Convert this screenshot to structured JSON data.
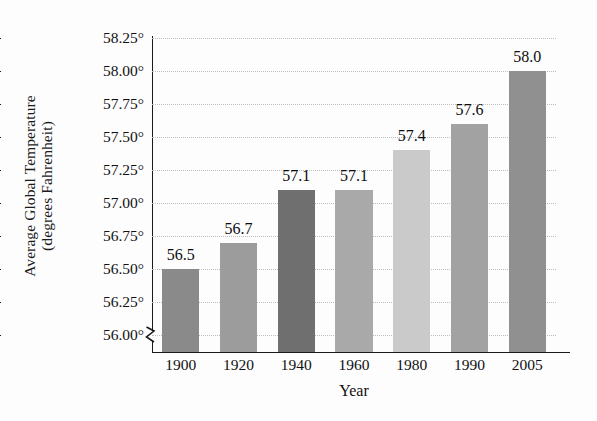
{
  "chart_data": {
    "type": "bar",
    "title": "",
    "xlabel": "Year",
    "ylabel": "Average Global Temperature (degrees Fahrenheit)",
    "ylabel_lines": [
      "Average Global Temperature",
      "(degrees Fahrenheit)"
    ],
    "categories": [
      "1900",
      "1920",
      "1940",
      "1960",
      "1980",
      "1990",
      "2005"
    ],
    "values": [
      56.5,
      56.7,
      57.1,
      57.1,
      57.4,
      57.6,
      58.0
    ],
    "value_labels": [
      "56.5",
      "56.7",
      "57.1",
      "57.1",
      "57.4",
      "57.6",
      "58.0"
    ],
    "bar_colors": [
      "#8a8a8a",
      "#9c9c9c",
      "#6f6f6f",
      "#a9a9a9",
      "#cacaca",
      "#a2a2a2",
      "#909090"
    ],
    "ylim": [
      55.875,
      58.25
    ],
    "ytick_values": [
      56.0,
      56.25,
      56.5,
      56.75,
      57.0,
      57.25,
      57.5,
      57.75,
      58.0,
      58.25
    ],
    "ytick_labels": [
      "56.00°",
      "56.25°",
      "56.50°",
      "56.75°",
      "57.00°",
      "57.25°",
      "57.50°",
      "57.75°",
      "58.00°",
      "58.25°"
    ],
    "grid": true,
    "grid_style": "dotted",
    "grid_color": "#bdbdbd",
    "legend": "none",
    "axis_break": true,
    "axis_break_note": "y-axis broken below 56.00°",
    "background_color": "#fdfdfd",
    "axis_color": "#1a1a1a"
  }
}
